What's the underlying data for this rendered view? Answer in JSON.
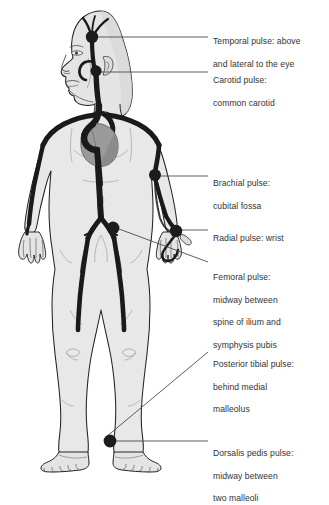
{
  "diagram": {
    "colors": {
      "background": "#ffffff",
      "body_fill": "#e8e8e8",
      "body_outline": "#222222",
      "artery": "#1a1a1a",
      "heart": "#9a9a9a",
      "pulse_dot": "#1c1c1c",
      "leader_line": "#4a4a4a",
      "label_text": "#333333"
    }
  },
  "labels": [
    {
      "id": "temporal",
      "name": "Temporal pulse",
      "line1": "Temporal pulse: above",
      "line2": "and lateral to the eye",
      "x": 213,
      "y": 25
    },
    {
      "id": "carotid",
      "name": "Carotid pulse",
      "line1": "Carotid pulse:",
      "line2": "common carotid",
      "x": 213,
      "y": 64
    },
    {
      "id": "brachial",
      "name": "Brachial pulse",
      "line1": "Brachial pulse:",
      "line2": "cubital fossa",
      "x": 213,
      "y": 167
    },
    {
      "id": "radial",
      "name": "Radial pulse",
      "line1": "Radial pulse: wrist",
      "line2": "",
      "x": 213,
      "y": 222
    },
    {
      "id": "femoral",
      "name": "Femoral pulse",
      "line1": "Femoral pulse:",
      "line2": "midway between",
      "line3": "spine of ilium and",
      "line4": "symphysis pubis",
      "x": 213,
      "y": 261
    },
    {
      "id": "posterior-tibial",
      "name": "Posterior tibial pulse",
      "line1": "Posterior tibial pulse:",
      "line2": "behind medial",
      "line3": "malleolus",
      "x": 213,
      "y": 348
    },
    {
      "id": "dorsalis-pedis",
      "name": "Dorsalis pedis pulse",
      "line1": "Dorsalis pedis pulse:",
      "line2": "midway between",
      "line3": "two malleoli",
      "x": 213,
      "y": 437
    }
  ],
  "pulse_points": [
    {
      "id": "temporal",
      "cx": 92,
      "cy": 37,
      "r": 6.2
    },
    {
      "id": "carotid",
      "cx": 96,
      "cy": 71,
      "r": 5.6
    },
    {
      "id": "brachial",
      "cx": 155,
      "cy": 175,
      "r": 6.0
    },
    {
      "id": "radial",
      "cx": 176,
      "cy": 231,
      "r": 6.2
    },
    {
      "id": "femoral",
      "cx": 113,
      "cy": 228,
      "r": 6.4
    },
    {
      "id": "dorsalis-pedis",
      "cx": 110,
      "cy": 441,
      "r": 6.4
    }
  ],
  "leader_lines": [
    {
      "id": "temporal",
      "x1": 98,
      "y1": 37,
      "x2": 208,
      "y2": 37
    },
    {
      "id": "carotid",
      "x1": 101,
      "y1": 72,
      "x2": 208,
      "y2": 72
    },
    {
      "id": "brachial",
      "x1": 161,
      "y1": 176,
      "x2": 208,
      "y2": 176
    },
    {
      "id": "radial",
      "x1": 181,
      "y1": 230,
      "x2": 208,
      "y2": 230
    },
    {
      "id": "femoral",
      "x1": 119,
      "y1": 229,
      "x2": 208,
      "y2": 262
    },
    {
      "id": "posterior-tibial",
      "x1": 106,
      "y1": 437,
      "x2": 208,
      "y2": 352
    },
    {
      "id": "dorsalis-pedis",
      "x1": 116,
      "y1": 441,
      "x2": 208,
      "y2": 441
    }
  ]
}
